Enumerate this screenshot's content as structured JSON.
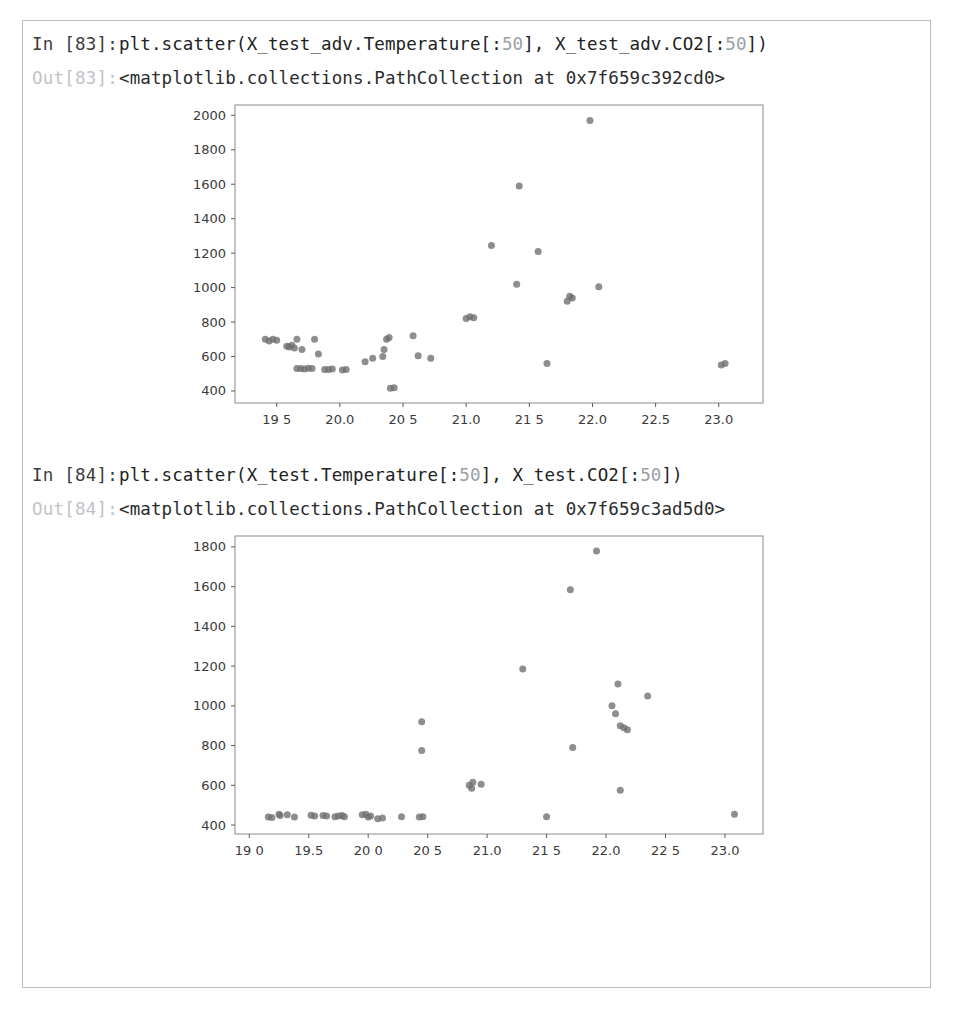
{
  "notebook": {
    "border_color": "#b9bcc0",
    "background": "#ffffff",
    "cells": [
      {
        "in_prompt": "In [83]:",
        "code_pre": "plt.scatter(X_test_adv.Temperature[:",
        "code_num1": "50",
        "code_mid": "], X_test_adv.CO2[:",
        "code_num2": "50",
        "code_post": "])",
        "out_prompt": "Out[83]:",
        "out_text": "<matplotlib.collections.PathCollection at 0x7f659c392cd0>"
      },
      {
        "in_prompt": "In [84]:",
        "code_pre": "plt.scatter(X_test.Temperature[:",
        "code_num1": "50",
        "code_mid": "], X_test.CO2[:",
        "code_num2": "50",
        "code_post": "])",
        "out_prompt": "Out[84]:",
        "out_text": "<matplotlib.collections.PathCollection at 0x7f659c3ad5d0>"
      }
    ]
  },
  "chart_data": [
    {
      "id": "scatter-adv",
      "type": "scatter",
      "title": "",
      "xlabel": "",
      "ylabel": "",
      "xlim": [
        19.17,
        23.35
      ],
      "ylim": [
        330,
        2060
      ],
      "xticks": [
        19.5,
        20.0,
        20.5,
        21.0,
        21.5,
        22.0,
        22.5,
        23.0
      ],
      "xticklabels": [
        "19 5",
        "20.0",
        "20 5",
        "21.0",
        "21 5",
        "22.0",
        "22.5",
        "23.0"
      ],
      "yticks": [
        400,
        600,
        800,
        1000,
        1200,
        1400,
        1600,
        1800,
        2000
      ],
      "yticklabels": [
        "400",
        "600",
        "800",
        "1000",
        "1200",
        "1400",
        "1600",
        "1800",
        "2000"
      ],
      "grid": false,
      "legend": null,
      "marker_color": "#6e6e6e",
      "marker_size": 7,
      "points": [
        [
          19.41,
          700
        ],
        [
          19.44,
          690
        ],
        [
          19.47,
          700
        ],
        [
          19.5,
          695
        ],
        [
          19.58,
          660
        ],
        [
          19.6,
          655
        ],
        [
          19.62,
          665
        ],
        [
          19.64,
          650
        ],
        [
          19.66,
          700
        ],
        [
          19.7,
          640
        ],
        [
          19.66,
          530
        ],
        [
          19.69,
          530
        ],
        [
          19.72,
          528
        ],
        [
          19.75,
          532
        ],
        [
          19.78,
          530
        ],
        [
          19.8,
          700
        ],
        [
          19.83,
          615
        ],
        [
          19.88,
          525
        ],
        [
          19.91,
          525
        ],
        [
          19.94,
          528
        ],
        [
          20.02,
          522
        ],
        [
          20.05,
          525
        ],
        [
          20.2,
          570
        ],
        [
          20.26,
          590
        ],
        [
          20.34,
          600
        ],
        [
          20.35,
          640
        ],
        [
          20.37,
          700
        ],
        [
          20.39,
          710
        ],
        [
          20.4,
          415
        ],
        [
          20.43,
          418
        ],
        [
          20.58,
          720
        ],
        [
          20.62,
          605
        ],
        [
          20.72,
          590
        ],
        [
          21.0,
          820
        ],
        [
          21.03,
          830
        ],
        [
          21.06,
          825
        ],
        [
          21.2,
          1245
        ],
        [
          21.4,
          1020
        ],
        [
          21.42,
          1590
        ],
        [
          21.57,
          1210
        ],
        [
          21.64,
          560
        ],
        [
          21.8,
          920
        ],
        [
          21.82,
          950
        ],
        [
          21.84,
          940
        ],
        [
          21.98,
          1970
        ],
        [
          22.05,
          1005
        ],
        [
          23.02,
          550
        ],
        [
          23.05,
          560
        ]
      ]
    },
    {
      "id": "scatter-plain",
      "type": "scatter",
      "title": "",
      "xlabel": "",
      "ylabel": "",
      "xlim": [
        18.88,
        23.32
      ],
      "ylim": [
        355,
        1855
      ],
      "xticks": [
        19.0,
        19.5,
        20.0,
        20.5,
        21.0,
        21.5,
        22.0,
        22.5,
        23.0
      ],
      "xticklabels": [
        "19 0",
        "19.5",
        "20 0",
        "20 5",
        "21.0",
        "21 5",
        "22.0",
        "22 5",
        "23.0"
      ],
      "yticks": [
        400,
        600,
        800,
        1000,
        1200,
        1400,
        1600,
        1800
      ],
      "yticklabels": [
        "400",
        "600",
        "800",
        "1000",
        "1200",
        "1400",
        "1600",
        "1800"
      ],
      "grid": false,
      "legend": null,
      "marker_color": "#6e6e6e",
      "marker_size": 7,
      "points": [
        [
          19.16,
          440
        ],
        [
          19.19,
          438
        ],
        [
          19.25,
          455
        ],
        [
          19.26,
          448
        ],
        [
          19.32,
          452
        ],
        [
          19.38,
          440
        ],
        [
          19.52,
          450
        ],
        [
          19.55,
          445
        ],
        [
          19.62,
          448
        ],
        [
          19.65,
          445
        ],
        [
          19.72,
          442
        ],
        [
          19.75,
          445
        ],
        [
          19.78,
          448
        ],
        [
          19.8,
          442
        ],
        [
          19.95,
          452
        ],
        [
          19.98,
          455
        ],
        [
          20.0,
          440
        ],
        [
          20.02,
          445
        ],
        [
          20.08,
          432
        ],
        [
          20.12,
          435
        ],
        [
          20.28,
          442
        ],
        [
          20.45,
          920
        ],
        [
          20.45,
          775
        ],
        [
          20.43,
          440
        ],
        [
          20.46,
          442
        ],
        [
          20.85,
          600
        ],
        [
          20.87,
          585
        ],
        [
          20.88,
          615
        ],
        [
          20.95,
          605
        ],
        [
          21.3,
          1185
        ],
        [
          21.5,
          442
        ],
        [
          21.7,
          1585
        ],
        [
          21.72,
          790
        ],
        [
          21.92,
          1780
        ],
        [
          22.05,
          1000
        ],
        [
          22.08,
          960
        ],
        [
          22.1,
          1110
        ],
        [
          22.12,
          900
        ],
        [
          22.15,
          890
        ],
        [
          22.18,
          880
        ],
        [
          22.12,
          575
        ],
        [
          22.35,
          1050
        ],
        [
          23.08,
          455
        ]
      ]
    }
  ]
}
